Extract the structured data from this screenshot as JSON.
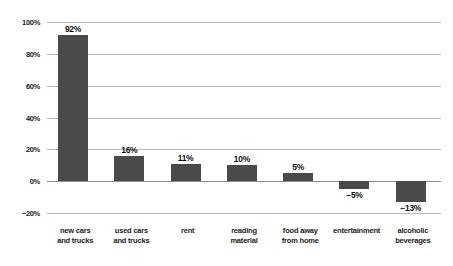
{
  "chart_data": {
    "type": "bar",
    "title": "",
    "subtitle": "",
    "xlabel": "",
    "ylabel": "",
    "categories": [
      "new cars and trucks",
      "used cars and trucks",
      "rent",
      "reading material",
      "food away from home",
      "entertainment",
      "alcoholic beverages"
    ],
    "category_lines": [
      [
        "new cars",
        "and trucks"
      ],
      [
        "used cars",
        "and trucks"
      ],
      [
        "rent"
      ],
      [
        "reading",
        "material"
      ],
      [
        "food away",
        "from home"
      ],
      [
        "entertainment"
      ],
      [
        "alcoholic",
        "beverages"
      ]
    ],
    "values": [
      92,
      16,
      11,
      10,
      5,
      -5,
      -13
    ],
    "value_labels": [
      "92%",
      "16%",
      "11%",
      "10%",
      "5%",
      "−5%",
      "−13%"
    ],
    "ylim": [
      -20,
      100
    ],
    "ytick_values": [
      100,
      80,
      60,
      40,
      20,
      0,
      -20
    ],
    "ytick_labels": [
      "100%",
      "80%",
      "60%",
      "40%",
      "20%",
      "0%",
      "−20%"
    ],
    "grid": true,
    "legend": false,
    "legend_position": "none",
    "series": [
      {
        "name": "percent change",
        "values": [
          92,
          16,
          11,
          10,
          5,
          -5,
          -13
        ]
      }
    ]
  },
  "style": {
    "bar_color": "#4a4a4a",
    "gridline_color": "#b9b9b9",
    "zero_line_color": "#8e8e8e",
    "text_color": "#1b1b1b",
    "background_color": "#ffffff"
  }
}
